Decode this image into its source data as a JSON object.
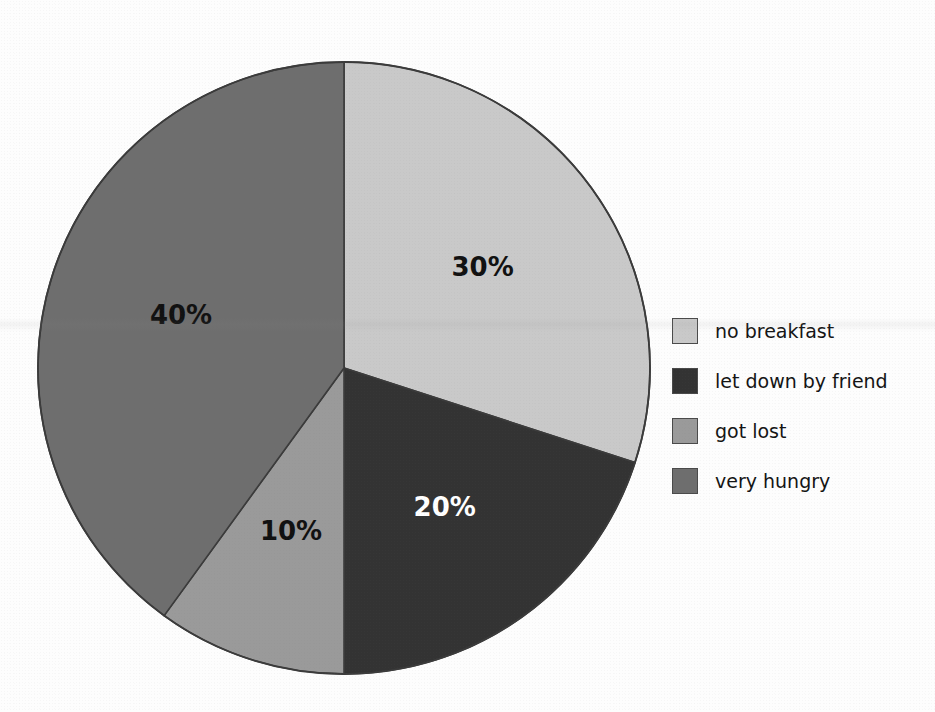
{
  "chart_data": {
    "type": "pie",
    "title": "",
    "xlabel": "",
    "ylabel": "",
    "legend_position": "right",
    "grid": false,
    "categories": [
      "no breakfast",
      "let down by friend",
      "got lost",
      "very hungry"
    ],
    "values": [
      30,
      20,
      10,
      40
    ],
    "value_labels": [
      "30%",
      "20%",
      "10%",
      "40%"
    ],
    "colors": [
      "#c9c9c9",
      "#333333",
      "#9a9a9a",
      "#6e6e6e"
    ],
    "label_colors": [
      "#111111",
      "#ffffff",
      "#111111",
      "#111111"
    ],
    "start_angle_deg": 0,
    "direction": "clockwise",
    "slices": [
      {
        "label": "no breakfast",
        "value": 30,
        "value_label": "30%",
        "color": "#c9c9c9",
        "label_color": "#111111",
        "start_deg": 0,
        "end_deg": 108
      },
      {
        "label": "let down by friend",
        "value": 20,
        "value_label": "20%",
        "color": "#333333",
        "label_color": "#ffffff",
        "start_deg": 108,
        "end_deg": 180
      },
      {
        "label": "got lost",
        "value": 10,
        "value_label": "10%",
        "color": "#9a9a9a",
        "label_color": "#111111",
        "start_deg": 180,
        "end_deg": 216
      },
      {
        "label": "very hungry",
        "value": 40,
        "value_label": "40%",
        "color": "#6e6e6e",
        "label_color": "#111111",
        "start_deg": 216,
        "end_deg": 360
      }
    ]
  },
  "legend": {
    "items": [
      {
        "label": "no breakfast",
        "color": "#c9c9c9"
      },
      {
        "label": "let down by friend",
        "color": "#333333"
      },
      {
        "label": "got lost",
        "color": "#9a9a9a"
      },
      {
        "label": "very hungry",
        "color": "#6e6e6e"
      }
    ]
  },
  "labels": {
    "slice_30": "30%",
    "slice_20": "20%",
    "slice_10": "10%",
    "slice_40": "40%"
  }
}
